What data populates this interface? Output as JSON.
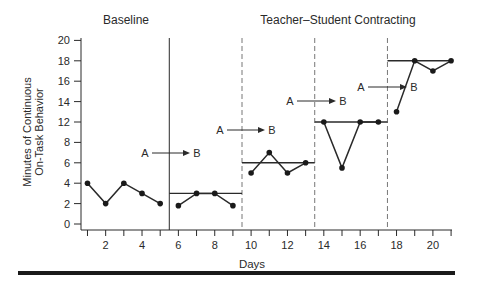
{
  "chart_data": {
    "type": "line",
    "title": "",
    "phase_labels": [
      {
        "text": "Baseline",
        "x_center_day": 3
      },
      {
        "text": "Teacher–Student Contracting",
        "x_center_day": 13
      }
    ],
    "xlabel": "Days",
    "ylabel_lines": [
      "Minutes of Continuous",
      "On-Task Behavior"
    ],
    "x_ticks": [
      2,
      4,
      6,
      8,
      10,
      12,
      14,
      16,
      18,
      20
    ],
    "x_minor_ticks": [
      1,
      2,
      3,
      4,
      5,
      6,
      7,
      8,
      9,
      10,
      11,
      12,
      13,
      14,
      15,
      16,
      17,
      18,
      19,
      20,
      21
    ],
    "xlim": [
      0,
      21
    ],
    "y_tick_labels": [
      "0",
      "2",
      "4",
      "6",
      "8",
      "12",
      "14",
      "16",
      "18",
      "20"
    ],
    "ylim": [
      0,
      20
    ],
    "grid": false,
    "legend": null,
    "phase_changes": [
      {
        "after_day": 5.5,
        "style": "solid"
      },
      {
        "after_day": 9.5,
        "style": "dashed"
      },
      {
        "after_day": 13.5,
        "style": "dashed"
      },
      {
        "after_day": 17.5,
        "style": "dashed"
      }
    ],
    "series": [
      {
        "name": "Baseline",
        "x": [
          1,
          2,
          3,
          4,
          5
        ],
        "values": [
          4,
          2,
          4,
          3,
          2
        ]
      },
      {
        "name": "Contracting criterion 3",
        "x": [
          6,
          7,
          8,
          9
        ],
        "values": [
          1.8,
          3,
          3,
          1.8
        ]
      },
      {
        "name": "Contracting criterion 6",
        "x": [
          10,
          11,
          12,
          13
        ],
        "values": [
          5,
          7,
          5,
          6
        ]
      },
      {
        "name": "Contracting criterion 12",
        "x": [
          14,
          15,
          16,
          17
        ],
        "values": [
          12,
          5.5,
          12,
          12
        ]
      },
      {
        "name": "Contracting criterion 18",
        "x": [
          18,
          19,
          20,
          21
        ],
        "values": [
          13,
          18,
          17,
          18
        ]
      }
    ],
    "criterion_lines": [
      {
        "from_day": 5.5,
        "to_day": 9.5,
        "value": 3
      },
      {
        "from_day": 9.5,
        "to_day": 13.5,
        "value": 6
      },
      {
        "from_day": 13.5,
        "to_day": 17.5,
        "value": 12
      },
      {
        "from_day": 17.5,
        "to_day": 21,
        "value": 18
      }
    ],
    "annotations": [
      {
        "text_a": "A",
        "text_b": "B",
        "phase": 2,
        "y_px": 153,
        "x_a_px": 145,
        "x_b_px": 196
      },
      {
        "text_a": "A",
        "text_b": "B",
        "phase": 3,
        "y_px": 130,
        "x_a_px": 220,
        "x_b_px": 271
      },
      {
        "text_a": "A",
        "text_b": "B",
        "phase": 4,
        "y_px": 101,
        "x_a_px": 290,
        "x_b_px": 342
      },
      {
        "text_a": "A",
        "text_b": "B",
        "phase": 5,
        "y_px": 87,
        "x_a_px": 361,
        "x_b_px": 413
      }
    ]
  }
}
